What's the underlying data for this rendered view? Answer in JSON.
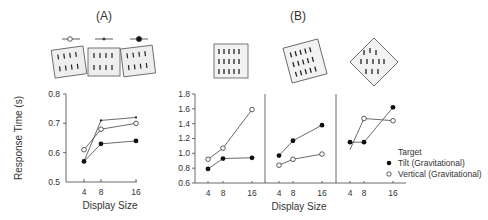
{
  "panels": {
    "a": {
      "label": "(A)"
    },
    "b": {
      "label": "(B)"
    }
  },
  "y_axis_label": "Response Time (s)",
  "x_axis_label_a": "Display Size",
  "x_axis_label_b": "Display Size",
  "legend": {
    "title": "Target",
    "items": [
      {
        "label": "Tilt (Gravitational)",
        "marker": "filled-circle"
      },
      {
        "label": "Vertical (Gravitational)",
        "marker": "open-circle"
      }
    ]
  },
  "panel_a_key_markers": [
    "open-circle",
    "small-dot",
    "filled-circle"
  ],
  "chart_data": [
    {
      "type": "line",
      "title": "(A)",
      "xlabel": "Display Size",
      "ylabel": "Response Time (s)",
      "x": [
        4,
        8,
        16
      ],
      "xticks": [
        "4",
        "8",
        "16"
      ],
      "yticks": [
        "0.5",
        "0.6",
        "0.7",
        "0.8"
      ],
      "ylim": [
        0.5,
        0.8
      ],
      "grid": false,
      "series": [
        {
          "name": "small dot (upright frame)",
          "marker": "small-dot",
          "values": [
            0.57,
            0.71,
            0.72
          ]
        },
        {
          "name": "open circle (left-tilted frame)",
          "marker": "open-circle",
          "values": [
            0.61,
            0.68,
            0.7
          ]
        },
        {
          "name": "filled circle (right-tilted frame)",
          "marker": "filled-circle",
          "values": [
            0.57,
            0.63,
            0.64
          ]
        }
      ]
    },
    {
      "type": "line",
      "title": "(B) upright frame",
      "xlabel": "Display Size",
      "ylabel": "Response Time (s)",
      "x": [
        4,
        8,
        16
      ],
      "xticks": [
        "4",
        "8",
        "16"
      ],
      "yticks": [
        "0.6",
        "0.8",
        "1.0",
        "1.2",
        "1.4",
        "1.6",
        "1.8"
      ],
      "ylim": [
        0.6,
        1.8
      ],
      "grid": false,
      "series": [
        {
          "name": "Tilt (Gravitational)",
          "marker": "filled-circle",
          "values": [
            0.79,
            0.93,
            0.94
          ]
        },
        {
          "name": "Vertical (Gravitational)",
          "marker": "open-circle",
          "values": [
            0.92,
            1.07,
            1.59
          ]
        }
      ]
    },
    {
      "type": "line",
      "title": "(B) tilted frame",
      "xlabel": "Display Size",
      "x": [
        4,
        8,
        16
      ],
      "xticks": [
        "4",
        "8",
        "16"
      ],
      "ylim": [
        0.6,
        1.8
      ],
      "grid": false,
      "series": [
        {
          "name": "Tilt (Gravitational)",
          "marker": "filled-circle",
          "values": [
            0.97,
            1.17,
            1.38
          ]
        },
        {
          "name": "Vertical (Gravitational)",
          "marker": "open-circle",
          "values": [
            0.84,
            0.92,
            0.99
          ]
        }
      ]
    },
    {
      "type": "line",
      "title": "(B) diamond frame",
      "xlabel": "Display Size",
      "x": [
        4,
        8,
        16
      ],
      "xticks": [
        "4",
        "8",
        "16"
      ],
      "ylim": [
        0.6,
        1.8
      ],
      "grid": false,
      "series": [
        {
          "name": "Tilt (Gravitational)",
          "marker": "filled-circle",
          "values": [
            1.15,
            1.15,
            1.62
          ]
        },
        {
          "name": "Vertical (Gravitational)",
          "marker": "open-circle",
          "values": [
            1.05,
            1.47,
            1.44
          ],
          "note": "x=4 point has no marker (line endpoint only)"
        }
      ]
    }
  ]
}
